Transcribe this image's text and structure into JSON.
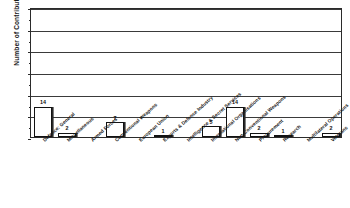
{
  "chart_data": {
    "type": "bar",
    "title": "",
    "xlabel": "",
    "ylabel": "Number of Contributions",
    "ylim": [
      0,
      60
    ],
    "yticks": [
      0,
      10,
      20,
      30,
      40,
      50,
      60
    ],
    "grid": true,
    "legend": "none",
    "categories": [
      "Defence: General",
      "Miscellaneous",
      "Armed Forces",
      "Conventional Weapons",
      "European Union",
      "Exports & Defence Industry",
      "Intelligence & Secret Services",
      "International Organisations",
      "Non-Conventional Weapons",
      "Procurement",
      "Research",
      "Multilateral Operations",
      "Veterans"
    ],
    "values": [
      14,
      2,
      0,
      7,
      0,
      1,
      0,
      5,
      14,
      2,
      1,
      0,
      2
    ],
    "data_labels": [
      "14",
      "2",
      "",
      "7",
      "",
      "1",
      "",
      "5",
      "14",
      "2",
      "1",
      "",
      "2"
    ]
  }
}
